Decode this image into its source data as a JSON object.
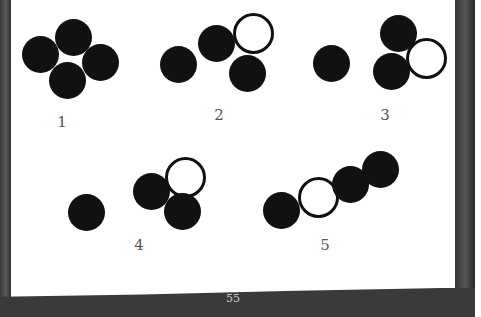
{
  "figures": [
    {
      "label": "1"
    },
    {
      "label": "2"
    },
    {
      "label": "3"
    },
    {
      "label": "4"
    },
    {
      "label": "5"
    }
  ],
  "page_number": "55",
  "colors": {
    "ink": "#111111",
    "label": "#555555",
    "border": "#3a3a3a"
  }
}
